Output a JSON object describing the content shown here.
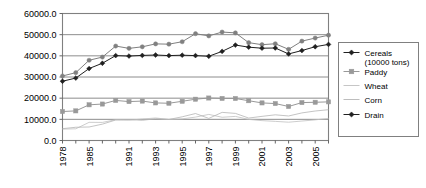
{
  "chart_data": {
    "type": "line",
    "title": "",
    "xlabel": "",
    "ylabel": "",
    "ylim": [
      0,
      60000
    ],
    "ytick_labels": [
      "60000.0",
      "50000.0",
      "40000.0",
      "30000.0",
      "20000.0",
      "10000.0",
      "0.0"
    ],
    "ytick_values": [
      60000,
      50000,
      40000,
      30000,
      20000,
      10000,
      0
    ],
    "grid": true,
    "legend_position": "right",
    "x": [
      1978,
      1980,
      1985,
      1988,
      1990,
      1991,
      1992,
      1993,
      1994,
      1995,
      1996,
      1997,
      1998,
      1999,
      2000,
      2001,
      2002,
      2003,
      2004,
      2005,
      2006
    ],
    "xtick_labels": [
      "1978",
      "",
      "1985",
      "",
      "",
      "1991",
      "",
      "1993",
      "",
      "1995",
      "",
      "1997",
      "",
      "1999",
      "",
      "2001",
      "",
      "2003",
      "",
      "2005",
      ""
    ],
    "xtick_labels_visible": [
      "1978",
      "1985",
      "1991",
      "1993",
      "1995",
      "1997",
      "1999",
      "2001",
      "2003",
      "2005"
    ],
    "series": [
      {
        "name": "Cereals (10000 tons)",
        "marker": "circle",
        "color": "#808080",
        "values": [
          30477,
          32056,
          37911,
          39408,
          44624,
          43529,
          44266,
          45649,
          45510,
          46662,
          50454,
          49417,
          51230,
          50839,
          46218,
          45264,
          45706,
          43070,
          46947,
          48402,
          49746
        ]
      },
      {
        "name": "Paddy",
        "marker": "square",
        "color": "#999999",
        "values": [
          13693,
          13991,
          16857,
          17224,
          18933,
          18381,
          18622,
          17758,
          17593,
          18523,
          19510,
          20073,
          19871,
          19849,
          18791,
          17758,
          17454,
          16066,
          17909,
          18059,
          18257
        ]
      },
      {
        "name": "Wheat",
        "marker": "none",
        "color": "#c0c0c0",
        "values": [
          5384,
          5521,
          8581,
          8543,
          9823,
          9595,
          10159,
          10639,
          9930,
          10221,
          11057,
          12329,
          10973,
          11388,
          9964,
          9387,
          9029,
          8649,
          9195,
          9744,
          10447
        ]
      },
      {
        "name": "Corn",
        "marker": "none",
        "color": "#b5b5b5",
        "values": [
          5595,
          6260,
          6383,
          7735,
          9682,
          9877,
          9538,
          10270,
          9928,
          11199,
          12747,
          10431,
          13295,
          12809,
          10600,
          11409,
          12131,
          11583,
          13029,
          13937,
          14548
        ]
      },
      {
        "name": "Drain",
        "marker": "diamond",
        "color": "#202020",
        "values": [
          28000,
          29500,
          34000,
          36500,
          40100,
          39900,
          40200,
          40400,
          40100,
          40300,
          40100,
          39800,
          42100,
          45100,
          44100,
          43600,
          43700,
          40900,
          42500,
          44300,
          45400
        ]
      }
    ]
  },
  "legend": {
    "items": [
      {
        "label": "Cereals",
        "label2": "(10000 tons)",
        "marker": "diamond"
      },
      {
        "label": "Paddy",
        "label2": "",
        "marker": "square"
      },
      {
        "label": "Wheat",
        "label2": "",
        "marker": "line"
      },
      {
        "label": "Corn",
        "label2": "",
        "marker": "line"
      },
      {
        "label": "Drain",
        "label2": "",
        "marker": "diamond"
      }
    ]
  },
  "colors": {
    "plot_border": "#808080",
    "gridline": "#808080",
    "axis_text": "#000000",
    "legend_border": "#808080",
    "background": "#ffffff"
  }
}
